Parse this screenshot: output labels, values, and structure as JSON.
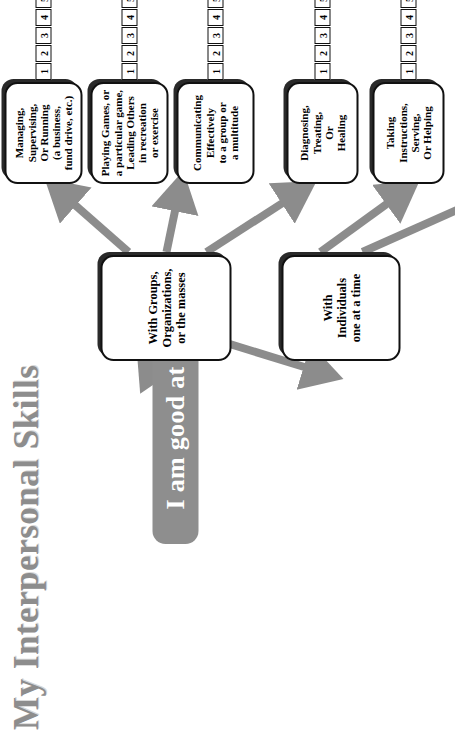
{
  "title": "My Interpersonal Skills",
  "root": {
    "label": "I am good at"
  },
  "colors": {
    "title_gray": "#8d8d8d",
    "root_fill": "#8e8e8e",
    "arrow_gray": "#8c8c8c",
    "node_border": "#111111",
    "node_shadow": "#2a2a2a",
    "node_fill": "#ffffff"
  },
  "scale": {
    "min": 1,
    "max": 7,
    "ticks": [
      "1",
      "2",
      "3",
      "4",
      "5",
      "6",
      "7"
    ]
  },
  "categories": [
    {
      "id": "groups",
      "label": "With Groups,\nOrganizations,\nor the masses",
      "lines": [
        "With Groups,",
        "Organizations,",
        "or the masses"
      ]
    },
    {
      "id": "individuals",
      "label": "With\nIndividuals\none at a time",
      "lines": [
        "With",
        "Individuals",
        "one at a time"
      ]
    }
  ],
  "skills": [
    {
      "id": "managing",
      "category": "groups",
      "lines": [
        "Managing,",
        "Supervising,",
        "Or Running",
        "(a business,",
        "fund drive, etc.)"
      ],
      "scale_ticks": [
        "1",
        "2",
        "3",
        "4",
        "5",
        "6",
        "7"
      ]
    },
    {
      "id": "playing-games",
      "category": "groups",
      "lines": [
        "Playing Games, or",
        "a particular game,",
        "Leading Others",
        "in recreation",
        "or exercise"
      ],
      "scale_ticks": [
        "1",
        "2",
        "3",
        "4",
        "5",
        "6",
        "7"
      ]
    },
    {
      "id": "communicating",
      "category": "groups",
      "lines": [
        "Communicating",
        "Effectively",
        "to a group or",
        "a multitude"
      ],
      "scale_ticks": [
        "1",
        "2",
        "3",
        "4",
        "5",
        "6",
        "7"
      ]
    },
    {
      "id": "diagnosing",
      "category": "individuals",
      "lines": [
        "Diagnosing,",
        "Treating,",
        "Or",
        "Healing"
      ],
      "scale_ticks": [
        "1",
        "2",
        "3",
        "4",
        "5",
        "6",
        "7"
      ]
    },
    {
      "id": "taking-instructions",
      "category": "individuals",
      "lines": [
        "Taking",
        "Instructions,",
        "Serving,",
        "Or Helping"
      ],
      "scale_ticks": [
        "1",
        "2",
        "3",
        "4",
        "5",
        "6",
        "7"
      ]
    }
  ]
}
